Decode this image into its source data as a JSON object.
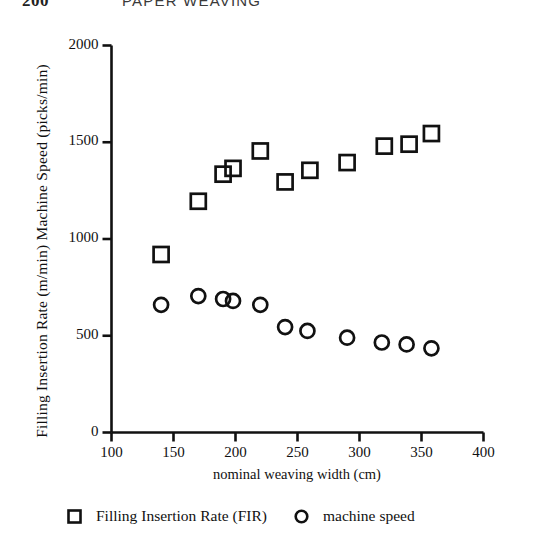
{
  "running_head": {
    "page_number": "200",
    "title": "PAPER WEAVING"
  },
  "chart_data": {
    "type": "scatter",
    "title": "",
    "xlabel": "nominal weaving width (cm)",
    "ylabel": "Filling Insertion Rate (m/min)  Machine Speed (picks/min)",
    "xlim": [
      100,
      400
    ],
    "ylim": [
      0,
      2000
    ],
    "xticks": [
      100,
      150,
      200,
      250,
      300,
      350,
      400
    ],
    "yticks": [
      0,
      500,
      1000,
      1500,
      2000
    ],
    "xtick_labels": [
      "100",
      "150",
      "200",
      "250",
      "300",
      "350",
      "400"
    ],
    "ytick_labels": [
      "0",
      "500",
      "1000",
      "1500",
      "2000"
    ],
    "grid": false,
    "legend_position": "bottom",
    "series": [
      {
        "name": "Filling Insertion Rate (FIR)",
        "marker": "square",
        "color": "#111111",
        "points": [
          {
            "x": 140,
            "y": 920
          },
          {
            "x": 170,
            "y": 1195
          },
          {
            "x": 190,
            "y": 1335
          },
          {
            "x": 198,
            "y": 1365
          },
          {
            "x": 220,
            "y": 1455
          },
          {
            "x": 240,
            "y": 1295
          },
          {
            "x": 260,
            "y": 1355
          },
          {
            "x": 290,
            "y": 1395
          },
          {
            "x": 320,
            "y": 1480
          },
          {
            "x": 340,
            "y": 1490
          },
          {
            "x": 358,
            "y": 1545
          }
        ]
      },
      {
        "name": "machine speed",
        "marker": "circle",
        "color": "#111111",
        "points": [
          {
            "x": 140,
            "y": 660
          },
          {
            "x": 170,
            "y": 705
          },
          {
            "x": 190,
            "y": 690
          },
          {
            "x": 198,
            "y": 680
          },
          {
            "x": 220,
            "y": 660
          },
          {
            "x": 240,
            "y": 545
          },
          {
            "x": 258,
            "y": 525
          },
          {
            "x": 290,
            "y": 490
          },
          {
            "x": 318,
            "y": 465
          },
          {
            "x": 338,
            "y": 455
          },
          {
            "x": 358,
            "y": 435
          }
        ]
      }
    ]
  },
  "legend": {
    "entries": [
      {
        "label": "Filling Insertion Rate (FIR)",
        "marker": "square"
      },
      {
        "label": "machine speed",
        "marker": "circle"
      }
    ]
  }
}
